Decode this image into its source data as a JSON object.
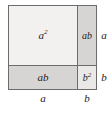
{
  "figure": {
    "name": "binomial-square-area-diagram",
    "colors": {
      "outline": "#6e6c6a",
      "a_squared_fill": "#f2f1f0",
      "ab_fill": "#d7d5d3",
      "b_squared_fill": "#eae9e7",
      "label_text": "#1b1b1b",
      "background": "#ffffff"
    },
    "regions": {
      "a_squared": {
        "label_base": "a",
        "label_exponent": "2"
      },
      "ab_top_right": {
        "label": "ab"
      },
      "ab_bottom_left": {
        "label": "ab"
      },
      "b_squared": {
        "label_base": "b",
        "label_exponent": "2"
      }
    },
    "dimensions": {
      "right_upper": "a",
      "right_lower": "b",
      "bottom_left": "a",
      "bottom_right": "b"
    }
  }
}
